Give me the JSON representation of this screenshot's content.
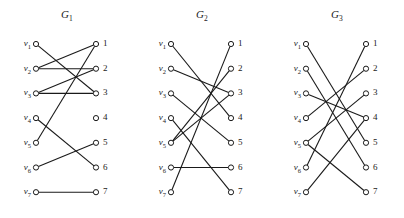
{
  "figure": {
    "caption": "",
    "left_labels": [
      "v1",
      "v2",
      "v3",
      "v4",
      "v5",
      "v6",
      "v7"
    ],
    "left_label_subs": [
      "1",
      "2",
      "3",
      "4",
      "5",
      "6",
      "7"
    ],
    "left_label_base": "v",
    "right_labels": [
      "1",
      "2",
      "3",
      "4",
      "5",
      "6",
      "7"
    ],
    "node_radius": 2.6,
    "colors": {
      "line": "#1a1a1a",
      "node_fill": "#ffffff",
      "node_stroke": "#1a1a1a",
      "text": "#1a1a1a"
    }
  },
  "graphs": [
    {
      "id": "g1",
      "title_base": "G",
      "title_sub": "1",
      "edges": [
        {
          "from": 1,
          "to": 3
        },
        {
          "from": 2,
          "to": 2
        },
        {
          "from": 2,
          "to": 1
        },
        {
          "from": 3,
          "to": 3
        },
        {
          "from": 3,
          "to": 2
        },
        {
          "from": 4,
          "to": 6
        },
        {
          "from": 5,
          "to": 1
        },
        {
          "from": 6,
          "to": 5
        },
        {
          "from": 7,
          "to": 7
        }
      ]
    },
    {
      "id": "g2",
      "title_base": "G",
      "title_sub": "2",
      "edges": [
        {
          "from": 1,
          "to": 4
        },
        {
          "from": 2,
          "to": 3
        },
        {
          "from": 3,
          "to": 5
        },
        {
          "from": 4,
          "to": 7
        },
        {
          "from": 5,
          "to": 2
        },
        {
          "from": 6,
          "to": 6
        },
        {
          "from": 7,
          "to": 1
        },
        {
          "from": 5,
          "to": 3
        }
      ]
    },
    {
      "id": "g3",
      "title_base": "G",
      "title_sub": "3",
      "edges": [
        {
          "from": 1,
          "to": 5
        },
        {
          "from": 2,
          "to": 6
        },
        {
          "from": 3,
          "to": 4
        },
        {
          "from": 4,
          "to": 2
        },
        {
          "from": 5,
          "to": 3
        },
        {
          "from": 5,
          "to": 7
        },
        {
          "from": 6,
          "to": 1
        },
        {
          "from": 7,
          "to": 4
        }
      ]
    }
  ]
}
